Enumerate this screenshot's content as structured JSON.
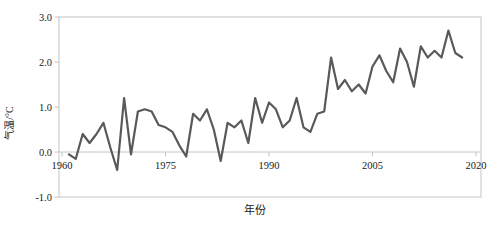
{
  "chart_data": {
    "type": "line",
    "title": "",
    "xlabel": "年份",
    "ylabel": "气温/°C",
    "x_ticks": [
      1960,
      1975,
      1990,
      2005,
      2020
    ],
    "y_ticks": [
      -1.0,
      0.0,
      1.0,
      2.0,
      3.0
    ],
    "xlim": [
      1960,
      2020
    ],
    "ylim": [
      -1.0,
      3.0
    ],
    "grid": false,
    "legend": "none",
    "line_color": "#595959",
    "axis_color": "#c4c4c4",
    "text_color": "#1a1a1a",
    "x": [
      1961,
      1962,
      1963,
      1964,
      1965,
      1966,
      1967,
      1968,
      1969,
      1970,
      1971,
      1972,
      1973,
      1974,
      1975,
      1976,
      1977,
      1978,
      1979,
      1980,
      1981,
      1982,
      1983,
      1984,
      1985,
      1986,
      1987,
      1988,
      1989,
      1990,
      1991,
      1992,
      1993,
      1994,
      1995,
      1996,
      1997,
      1998,
      1999,
      2000,
      2001,
      2002,
      2003,
      2004,
      2005,
      2006,
      2007,
      2008,
      2009,
      2010,
      2011,
      2012,
      2013,
      2014,
      2015,
      2016,
      2017,
      2018
    ],
    "values": [
      -0.05,
      -0.15,
      0.4,
      0.2,
      0.4,
      0.65,
      0.1,
      -0.4,
      1.2,
      -0.05,
      0.9,
      0.95,
      0.9,
      0.6,
      0.55,
      0.45,
      0.15,
      -0.1,
      0.85,
      0.7,
      0.95,
      0.5,
      -0.2,
      0.65,
      0.55,
      0.7,
      0.2,
      1.2,
      0.65,
      1.1,
      0.95,
      0.55,
      0.7,
      1.2,
      0.55,
      0.45,
      0.85,
      0.9,
      2.1,
      1.4,
      1.6,
      1.35,
      1.5,
      1.3,
      1.9,
      2.15,
      1.8,
      1.55,
      2.3,
      2.0,
      1.45,
      2.35,
      2.1,
      2.25,
      2.1,
      2.7,
      2.2,
      2.1
    ]
  }
}
